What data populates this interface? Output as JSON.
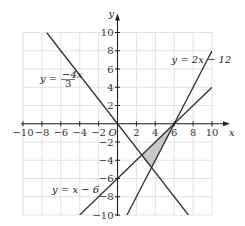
{
  "chart_data": {
    "type": "line",
    "title": "",
    "xlabel": "x",
    "ylabel": "y",
    "origin_label": "O",
    "xlim": [
      -10,
      10
    ],
    "ylim": [
      -10,
      10
    ],
    "grid": true,
    "grid_step": 2,
    "x_ticks": [
      -10,
      -8,
      -6,
      -4,
      -2,
      2,
      4,
      6,
      8,
      10
    ],
    "y_ticks": [
      10,
      8,
      6,
      4,
      2,
      -2,
      -4,
      -6,
      -8,
      -10
    ],
    "x_tick_labels": [
      "−10",
      "−8",
      "−6",
      "−4",
      "−2",
      "2",
      "4",
      "6",
      "8",
      "10"
    ],
    "y_tick_labels": [
      "10",
      "8",
      "6",
      "4",
      "2",
      "−2",
      "−4",
      "−6",
      "−8",
      "−10"
    ],
    "series": [
      {
        "name": "y = 2x − 12",
        "slope": 2,
        "intercept": -12,
        "points": [
          [
            1,
            -10
          ],
          [
            10,
            8
          ]
        ]
      },
      {
        "name": "y = x − 6",
        "slope": 1,
        "intercept": -6,
        "points": [
          [
            -4,
            -10
          ],
          [
            10,
            4
          ]
        ]
      },
      {
        "name": "y = −4x/3",
        "slope": -1.3333,
        "intercept": 0,
        "points": [
          [
            -7.5,
            10
          ],
          [
            7.5,
            -10
          ]
        ]
      }
    ],
    "annotations": [
      {
        "text": "y = 2x − 12",
        "x": 5.5,
        "y": 7
      },
      {
        "text": "y = −4x/3",
        "x": -8.5,
        "y": 4.5
      },
      {
        "text": "y = x − 6",
        "x": -7,
        "y": -7
      }
    ],
    "shaded_region": {
      "description": "triangle bounded by the three lines",
      "vertices": [
        [
          6,
          0
        ],
        [
          2.571,
          -3.429
        ],
        [
          3.6,
          -4.8
        ]
      ],
      "fill": "#c8c8c8"
    },
    "colors": {
      "line": "#333333",
      "grid": "#d6d6d6",
      "axis": "#222222"
    }
  }
}
